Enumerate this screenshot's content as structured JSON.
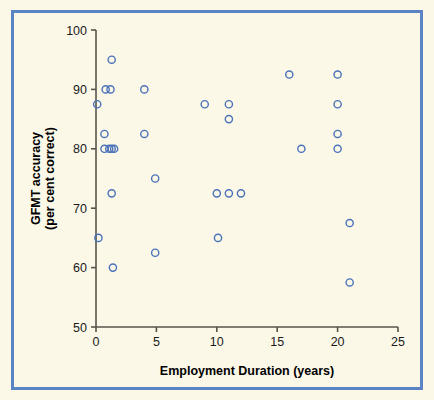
{
  "figure": {
    "background_color": "#fbf8e8",
    "border_color": "#5b84c4",
    "marker_color": "#4a72b8",
    "axis_color": "#58544a"
  },
  "chart_data": {
    "type": "scatter",
    "title": "",
    "xlabel": "Employment Duration (years)",
    "ylabel": "GFMT accuracy\n(per cent correct)",
    "ylabel_line1": "GFMT accuracy",
    "ylabel_line2": "(per cent correct)",
    "xlim": [
      0,
      25
    ],
    "ylim": [
      50,
      100
    ],
    "xticks": [
      0,
      5,
      10,
      15,
      20,
      25
    ],
    "yticks": [
      50,
      60,
      70,
      80,
      90,
      100
    ],
    "xtick_labels": [
      "0",
      "5",
      "10",
      "15",
      "20",
      "25"
    ],
    "ytick_labels": [
      "50",
      "60",
      "70",
      "80",
      "90",
      "100"
    ],
    "grid": false,
    "legend": false,
    "marker": "open-circle",
    "points": [
      {
        "x": 0.1,
        "y": 87.5
      },
      {
        "x": 0.2,
        "y": 65.0
      },
      {
        "x": 0.7,
        "y": 82.5
      },
      {
        "x": 0.8,
        "y": 90.0
      },
      {
        "x": 1.2,
        "y": 90.0
      },
      {
        "x": 0.7,
        "y": 80.0
      },
      {
        "x": 1.1,
        "y": 80.0
      },
      {
        "x": 1.3,
        "y": 80.0
      },
      {
        "x": 1.5,
        "y": 80.0
      },
      {
        "x": 1.3,
        "y": 95.0
      },
      {
        "x": 1.3,
        "y": 72.5
      },
      {
        "x": 1.4,
        "y": 60.0
      },
      {
        "x": 4.0,
        "y": 90.0
      },
      {
        "x": 4.0,
        "y": 82.5
      },
      {
        "x": 4.9,
        "y": 75.0
      },
      {
        "x": 4.9,
        "y": 62.5
      },
      {
        "x": 9.0,
        "y": 87.5
      },
      {
        "x": 10.0,
        "y": 72.5
      },
      {
        "x": 10.1,
        "y": 65.0
      },
      {
        "x": 11.0,
        "y": 87.5
      },
      {
        "x": 11.0,
        "y": 85.0
      },
      {
        "x": 11.0,
        "y": 72.5
      },
      {
        "x": 12.0,
        "y": 72.5
      },
      {
        "x": 16.0,
        "y": 92.5
      },
      {
        "x": 17.0,
        "y": 80.0
      },
      {
        "x": 20.0,
        "y": 92.5
      },
      {
        "x": 20.0,
        "y": 87.5
      },
      {
        "x": 20.0,
        "y": 82.5
      },
      {
        "x": 20.0,
        "y": 80.0
      },
      {
        "x": 21.0,
        "y": 67.5
      },
      {
        "x": 21.0,
        "y": 57.5
      }
    ]
  }
}
